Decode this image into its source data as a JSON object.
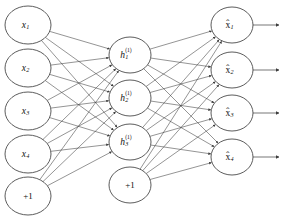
{
  "diagram": {
    "type": "neural-network",
    "background_color": "#ffffff",
    "node_stroke_color": "#4a4a4a",
    "edge_color": "#3c3c3c",
    "label_color": "#111111",
    "layers": [
      {
        "name": "input-layer",
        "nodes": [
          {
            "id": "x1",
            "label": "x",
            "sub": "1",
            "sup": "",
            "accent": "none",
            "cx": 28,
            "cy": 25,
            "rx": 23,
            "ry": 19
          },
          {
            "id": "x2",
            "label": "x",
            "sub": "2",
            "sup": "",
            "accent": "none",
            "cx": 28,
            "cy": 68,
            "rx": 23,
            "ry": 19
          },
          {
            "id": "x3",
            "label": "x",
            "sub": "3",
            "sup": "",
            "accent": "none",
            "cx": 28,
            "cy": 111,
            "rx": 23,
            "ry": 19
          },
          {
            "id": "x4",
            "label": "x",
            "sub": "4",
            "sup": "",
            "accent": "none",
            "cx": 28,
            "cy": 154,
            "rx": 23,
            "ry": 19
          },
          {
            "id": "bias-in",
            "label": "+1",
            "sub": "",
            "sup": "",
            "accent": "none",
            "cx": 28,
            "cy": 196,
            "rx": 23,
            "ry": 19
          }
        ]
      },
      {
        "name": "hidden-layer",
        "nodes": [
          {
            "id": "h1",
            "label": "h",
            "sub": "1",
            "sup": "(1)",
            "accent": "none",
            "cx": 130,
            "cy": 55,
            "rx": 21,
            "ry": 18
          },
          {
            "id": "h2",
            "label": "h",
            "sub": "2",
            "sup": "(1)",
            "accent": "none",
            "cx": 130,
            "cy": 98,
            "rx": 21,
            "ry": 18
          },
          {
            "id": "h3",
            "label": "h",
            "sub": "3",
            "sup": "(1)",
            "accent": "none",
            "cx": 130,
            "cy": 142,
            "rx": 21,
            "ry": 18
          },
          {
            "id": "bias-hidden",
            "label": "+1",
            "sub": "",
            "sup": "",
            "accent": "none",
            "cx": 130,
            "cy": 185,
            "rx": 21,
            "ry": 18
          }
        ]
      },
      {
        "name": "output-layer",
        "nodes": [
          {
            "id": "xhat1",
            "label": "x",
            "sub": "1",
            "sup": "",
            "accent": "hat",
            "cx": 232,
            "cy": 25,
            "rx": 21,
            "ry": 18
          },
          {
            "id": "xhat2",
            "label": "x",
            "sub": "2",
            "sup": "",
            "accent": "hat",
            "cx": 232,
            "cy": 70,
            "rx": 21,
            "ry": 18
          },
          {
            "id": "xhat3",
            "label": "x",
            "sub": "3",
            "sup": "",
            "accent": "hat",
            "cx": 232,
            "cy": 113,
            "rx": 21,
            "ry": 18
          },
          {
            "id": "xhat4",
            "label": "x",
            "sub": "4",
            "sup": "",
            "accent": "hat",
            "cx": 232,
            "cy": 157,
            "rx": 21,
            "ry": 18
          }
        ]
      }
    ],
    "connections": {
      "input_to_hidden": "fully-connected",
      "hidden_to_output": "fully-connected",
      "direction": "left-to-right",
      "arrowheads": true
    },
    "output_arrows": [
      {
        "id": "out-arrow-1",
        "x1": 253,
        "y": 25,
        "x2": 279
      },
      {
        "id": "out-arrow-2",
        "x1": 253,
        "y": 70,
        "x2": 279
      },
      {
        "id": "out-arrow-3",
        "x1": 253,
        "y": 113,
        "x2": 279
      },
      {
        "id": "out-arrow-4",
        "x1": 253,
        "y": 157,
        "x2": 279
      }
    ]
  }
}
